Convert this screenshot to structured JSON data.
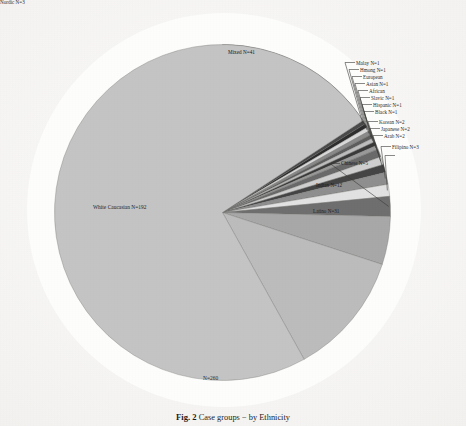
{
  "figure": {
    "caption_number": "Fig. 2",
    "caption_text": "Case groups − by Ethnicity",
    "total_label": "N=260"
  },
  "chart_data": {
    "type": "pie",
    "title": "Case groups − by Ethnicity",
    "total": 260,
    "total_label": "N=260",
    "start_angle_deg": 0,
    "direction": "clockwise",
    "legend": "none (direct labels with leader lines)",
    "categories": [
      "Mixed",
      "Malay",
      "Hmong",
      "European",
      "Asian",
      "African",
      "Slavic",
      "Hispanic",
      "Black",
      "Korean",
      "Japanese",
      "Arab",
      "Filipino",
      "Nordic",
      "Chinese",
      "Indian",
      "Latino",
      "White Caucasian"
    ],
    "values": [
      41,
      1,
      1,
      1,
      1,
      1,
      1,
      1,
      1,
      2,
      2,
      2,
      3,
      3,
      5,
      12,
      31,
      192
    ],
    "slices": [
      {
        "label": "Mixed N=41",
        "name": "Mixed",
        "value": 41,
        "color": "#7c7c7c",
        "label_position": "inside"
      },
      {
        "label": "Malay N=1",
        "name": "Malay",
        "value": 1,
        "color": "#4a4a4a",
        "label_position": "leader-right"
      },
      {
        "label": "Hmong N=1",
        "name": "Hmong",
        "value": 1,
        "color": "#2e2e2e",
        "label_position": "leader-right"
      },
      {
        "label": "European",
        "name": "European",
        "value": 1,
        "color": "#d8d8d8",
        "label_position": "leader-right"
      },
      {
        "label": "Asian N=1",
        "name": "Asian",
        "value": 1,
        "color": "#8a8a8a",
        "label_position": "leader-right"
      },
      {
        "label": "African",
        "name": "African",
        "value": 1,
        "color": "#5e5e5e",
        "label_position": "leader-right"
      },
      {
        "label": "Slavic N=1",
        "name": "Slavic",
        "value": 1,
        "color": "#bdbdbd",
        "label_position": "leader-right"
      },
      {
        "label": "Hispanic N=1",
        "name": "Hispanic",
        "value": 1,
        "color": "#3a3a3a",
        "label_position": "leader-right"
      },
      {
        "label": "Black N=1",
        "name": "Black",
        "value": 1,
        "color": "#9a9a9a",
        "label_position": "leader-right"
      },
      {
        "label": "Korean N=2",
        "name": "Korean",
        "value": 2,
        "color": "#6a6a6a",
        "label_position": "leader-right"
      },
      {
        "label": "Japanese N=2",
        "name": "Japanese",
        "value": 2,
        "color": "#cfcfcf",
        "label_position": "leader-right"
      },
      {
        "label": "Arab N=2",
        "name": "Arab",
        "value": 2,
        "color": "#454545",
        "label_position": "leader-right"
      },
      {
        "label": "Filipino N=3",
        "name": "Filipino",
        "value": 3,
        "color": "#8f8f8f",
        "label_position": "leader-right"
      },
      {
        "label": "Nordic N=3",
        "name": "Nordic",
        "value": 3,
        "color": "#e2e2e2",
        "label_position": "leader-right"
      },
      {
        "label": "Chinese N=5",
        "name": "Chinese",
        "value": 5,
        "color": "#6f6f6f",
        "label_position": "leader-right"
      },
      {
        "label": "Indian N=12",
        "name": "Indian",
        "value": 12,
        "color": "#a8a8a8",
        "label_position": "inside"
      },
      {
        "label": "Latino N=31",
        "name": "Latino",
        "value": 31,
        "color": "#bcbcbc",
        "label_position": "outside-right"
      },
      {
        "label": "White Caucasian N=192",
        "name": "White Caucasian",
        "value": 192,
        "color": "#c4c4c4",
        "label_position": "inside-left"
      }
    ],
    "labels": {
      "mixed": "Mixed N=41",
      "malay": "Malay N=1",
      "hmong": "Hmong N=1",
      "european": "European",
      "asian": "Asian N=1",
      "african": "African",
      "slavic": "Slavic N=1",
      "hispanic": "Hispanic N=1",
      "black": "Black N=1",
      "korean": "Korean N=2",
      "japanese": "Japanese N=2",
      "arab": "Arab N=2",
      "filipino": "Filipino N=3",
      "nordic": "Nordic N=3",
      "chinese": "Chinese N=5",
      "indian": "Indian N=12",
      "latino": "Latino N=31",
      "white_caucasian": "White Caucasian N=192"
    },
    "colors": {
      "background_disc": "#fdfdfc",
      "page": "#f2f1ef",
      "leader_line": "#3a3a38",
      "text": "#2b2b29"
    }
  }
}
